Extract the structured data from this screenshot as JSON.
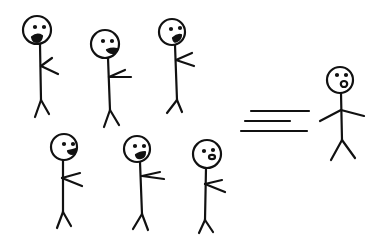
{
  "scene": {
    "description": "Hand-drawn stick figures: six figures on the left gesturing/shouting toward a single figure on the right that is moving away quickly (speed lines).",
    "stroke_color": "#111111",
    "background": "#ffffff",
    "groups": {
      "crowd_label": "crowd of six stick figures",
      "runner_label": "running stick figure",
      "motion_label": "speed lines"
    }
  }
}
